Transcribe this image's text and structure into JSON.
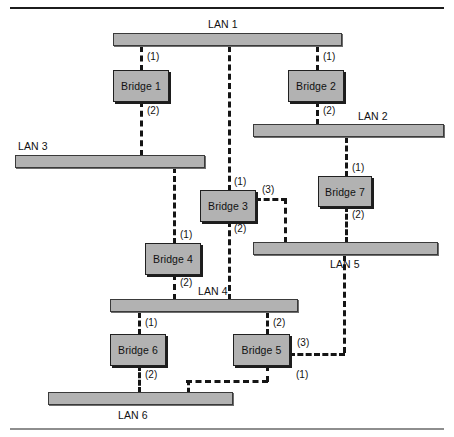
{
  "figure": {
    "colors": {
      "node_fill": "#b2b2b2",
      "node_stroke": "#202020",
      "link": "#151515",
      "rule_top": "#1c1c1c",
      "rule_bottom": "#8e8e8e"
    }
  },
  "lans": [
    {
      "id": "lan1",
      "label": "LAN 1",
      "x": 113,
      "y": 33,
      "w": 229,
      "h": 13,
      "label_x": 208,
      "label_y": 18
    },
    {
      "id": "lan2",
      "label": "LAN 2",
      "x": 253,
      "y": 124,
      "w": 191,
      "h": 13,
      "label_x": 358,
      "label_y": 110
    },
    {
      "id": "lan3",
      "label": "LAN 3",
      "x": 15,
      "y": 155,
      "w": 190,
      "h": 13,
      "label_x": 18,
      "label_y": 140
    },
    {
      "id": "lan4",
      "label": "LAN 4",
      "x": 110,
      "y": 299,
      "w": 188,
      "h": 13,
      "label_x": 198,
      "label_y": 285
    },
    {
      "id": "lan5",
      "label": "LAN 5",
      "x": 253,
      "y": 242,
      "w": 185,
      "h": 13,
      "label_x": 330,
      "label_y": 258
    },
    {
      "id": "lan6",
      "label": "LAN 6",
      "x": 48,
      "y": 392,
      "w": 185,
      "h": 13,
      "label_x": 118,
      "label_y": 409
    }
  ],
  "bridges": [
    {
      "id": "bridge1",
      "label": "Bridge 1",
      "x": 113,
      "y": 70,
      "w": 56,
      "h": 32
    },
    {
      "id": "bridge2",
      "label": "Bridge 2",
      "x": 288,
      "y": 70,
      "w": 56,
      "h": 32
    },
    {
      "id": "bridge3",
      "label": "Bridge 3",
      "x": 200,
      "y": 190,
      "w": 56,
      "h": 32
    },
    {
      "id": "bridge4",
      "label": "Bridge 4",
      "x": 145,
      "y": 243,
      "w": 56,
      "h": 32
    },
    {
      "id": "bridge5",
      "label": "Bridge 5",
      "x": 233,
      "y": 334,
      "w": 57,
      "h": 32
    },
    {
      "id": "bridge6",
      "label": "Bridge 6",
      "x": 110,
      "y": 334,
      "w": 56,
      "h": 32
    },
    {
      "id": "bridge7",
      "label": "Bridge 7",
      "x": 318,
      "y": 176,
      "w": 54,
      "h": 31
    }
  ],
  "links": {
    "vertical": [
      {
        "id": "lan1-bridge1",
        "x": 140,
        "y": 46,
        "h": 25
      },
      {
        "id": "bridge1-lan3",
        "x": 140,
        "y": 101,
        "h": 55
      },
      {
        "id": "lan1-bridge3",
        "x": 228,
        "y": 46,
        "h": 145
      },
      {
        "id": "bridge3-lan4",
        "x": 228,
        "y": 221,
        "h": 79
      },
      {
        "id": "lan1-bridge2",
        "x": 316,
        "y": 46,
        "h": 25
      },
      {
        "id": "bridge2-lan2",
        "x": 316,
        "y": 101,
        "h": 24
      },
      {
        "id": "lan2-bridge7",
        "x": 345,
        "y": 137,
        "h": 40
      },
      {
        "id": "bridge7-lan5",
        "x": 345,
        "y": 206,
        "h": 37
      },
      {
        "id": "lan3-bridge4",
        "x": 173,
        "y": 167,
        "h": 77
      },
      {
        "id": "bridge4-lan4",
        "x": 173,
        "y": 274,
        "h": 26
      },
      {
        "id": "bridge3-port3-drop",
        "x": 284,
        "y": 198,
        "h": 45
      },
      {
        "id": "lan4-bridge6",
        "x": 138,
        "y": 312,
        "h": 23
      },
      {
        "id": "bridge6-lan6",
        "x": 138,
        "y": 365,
        "h": 28
      },
      {
        "id": "lan4-bridge5",
        "x": 266,
        "y": 312,
        "h": 23
      },
      {
        "id": "bridge5-port1-drop",
        "x": 266,
        "y": 365,
        "h": 17
      },
      {
        "id": "bridge5-port1-riser",
        "x": 187,
        "y": 380,
        "h": 13
      },
      {
        "id": "bridge5-port3-riser",
        "x": 343,
        "y": 255,
        "h": 98
      }
    ],
    "horizontal": [
      {
        "id": "bridge3-port3-arm",
        "x": 255,
        "y": 198,
        "w": 32
      },
      {
        "id": "bridge5-port1-arm",
        "x": 186,
        "y": 380,
        "w": 82
      },
      {
        "id": "bridge5-port3-arm",
        "x": 289,
        "y": 353,
        "w": 56
      }
    ]
  },
  "ports": [
    {
      "id": "bridge1-port1",
      "label": "(1)",
      "x": 147,
      "y": 51
    },
    {
      "id": "bridge1-port2",
      "label": "(2)",
      "x": 147,
      "y": 105
    },
    {
      "id": "bridge2-port1",
      "label": "(1)",
      "x": 323,
      "y": 51
    },
    {
      "id": "bridge2-port2",
      "label": "(2)",
      "x": 323,
      "y": 105
    },
    {
      "id": "bridge3-port1",
      "label": "(1)",
      "x": 234,
      "y": 176
    },
    {
      "id": "bridge3-port2",
      "label": "(2)",
      "x": 234,
      "y": 223
    },
    {
      "id": "bridge3-port3",
      "label": "(3)",
      "x": 262,
      "y": 184
    },
    {
      "id": "bridge4-port1",
      "label": "(1)",
      "x": 180,
      "y": 229
    },
    {
      "id": "bridge4-port2",
      "label": "(2)",
      "x": 180,
      "y": 277
    },
    {
      "id": "bridge7-port1",
      "label": "(1)",
      "x": 352,
      "y": 162
    },
    {
      "id": "bridge7-port2",
      "label": "(2)",
      "x": 352,
      "y": 209
    },
    {
      "id": "bridge6-port1",
      "label": "(1)",
      "x": 145,
      "y": 317
    },
    {
      "id": "bridge6-port2",
      "label": "(2)",
      "x": 145,
      "y": 369
    },
    {
      "id": "bridge5-port2",
      "label": "(2)",
      "x": 273,
      "y": 317
    },
    {
      "id": "bridge5-port1",
      "label": "(1)",
      "x": 296,
      "y": 369
    },
    {
      "id": "bridge5-port3",
      "label": "(3)",
      "x": 297,
      "y": 337
    }
  ]
}
